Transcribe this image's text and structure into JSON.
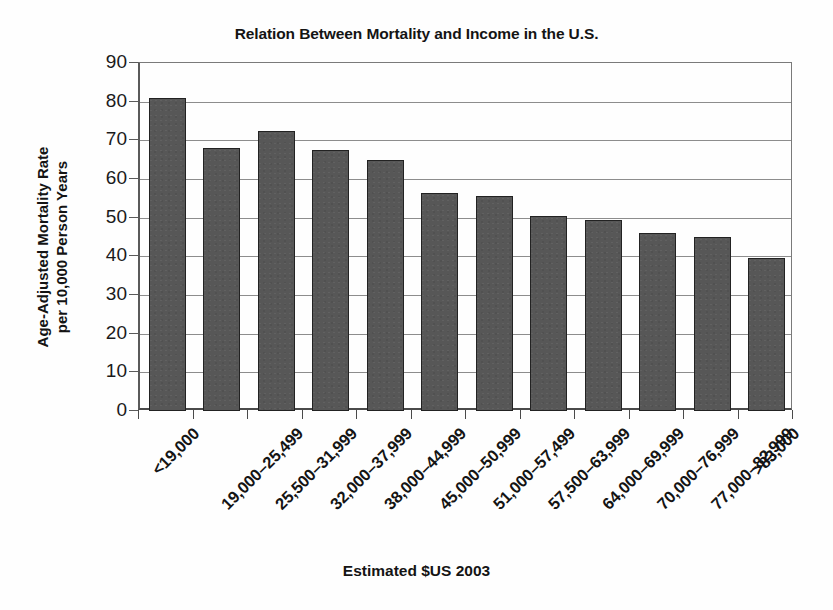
{
  "chart_data": {
    "type": "bar",
    "title": "Relation Between Mortality and Income in the U.S.",
    "xlabel": "Estimated $US 2003",
    "ylabel_line1": "Age-Adjusted Mortality Rate",
    "ylabel_line2": "per 10,000 Person Years",
    "categories": [
      "<19,000",
      "19,000–25,499",
      "25,500–31,999",
      "32,000–37,999",
      "38,000–44,999",
      "45,000–50,999",
      "51,000–57,499",
      "57,500–63,999",
      "64,000–69,999",
      "70,000–76,999",
      "77,000–82,999",
      ">83,000"
    ],
    "values": [
      81,
      68,
      72.5,
      67.5,
      65,
      56.5,
      55.5,
      50.5,
      49.5,
      46,
      45,
      39.5
    ],
    "ylim": [
      0,
      90
    ],
    "y_ticks": [
      0,
      10,
      20,
      30,
      40,
      50,
      60,
      70,
      80,
      90
    ],
    "y_tick_labels": [
      "0",
      "10",
      "20",
      "30",
      "40",
      "50",
      "60",
      "70",
      "80",
      "90"
    ],
    "grid": true,
    "grid_axis": "y",
    "legend": null,
    "legend_position": "none",
    "bar_color": "#575757",
    "bar_border_color": "#222222",
    "plot_background": "#fefefe",
    "grid_color": "#8d8d8d",
    "axis_color": "#4a4a4a",
    "text_color": "#141414"
  }
}
